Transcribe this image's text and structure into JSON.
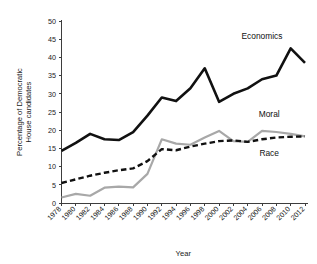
{
  "chart_data": {
    "type": "line",
    "title": "",
    "xlabel": "Year",
    "ylabel": "Percentage of Democratic House candidates",
    "ylabel_line1": "Percentage of Democratic",
    "ylabel_line2": "House candidates",
    "ylim": [
      0,
      50
    ],
    "yticks": [
      0,
      5,
      10,
      15,
      20,
      25,
      30,
      35,
      40,
      45,
      50
    ],
    "grid": false,
    "legend_position": "inline-annotations",
    "categories": [
      "1978",
      "1980",
      "1982",
      "1984",
      "1986",
      "1988",
      "1990",
      "1992",
      "1994",
      "1996",
      "1998",
      "2000",
      "2002",
      "2004",
      "2006",
      "2008",
      "2010",
      "2012"
    ],
    "x": [
      1978,
      1980,
      1982,
      1984,
      1986,
      1988,
      1990,
      1992,
      1994,
      1996,
      1998,
      2000,
      2002,
      2004,
      2006,
      2008,
      2010,
      2012
    ],
    "series": [
      {
        "name": "Economics",
        "color": "#111111",
        "style": "solid",
        "width": 2.6,
        "values": [
          14.3,
          16.5,
          19.0,
          17.5,
          17.3,
          19.5,
          24.0,
          29.0,
          28.0,
          31.5,
          37.0,
          27.8,
          30.0,
          31.5,
          34.0,
          35.0,
          42.5,
          38.5
        ]
      },
      {
        "name": "Moral",
        "color": "#a8a8a8",
        "style": "solid",
        "width": 2.2,
        "values": [
          1.5,
          2.5,
          2.0,
          4.2,
          4.5,
          4.3,
          8.0,
          17.5,
          16.3,
          16.0,
          18.0,
          19.8,
          17.0,
          16.8,
          19.8,
          19.5,
          19.0,
          18.3
        ]
      },
      {
        "name": "Race",
        "color": "#111111",
        "style": "dashed",
        "width": 2.4,
        "values": [
          5.5,
          6.5,
          7.5,
          8.3,
          9.0,
          9.5,
          11.5,
          14.8,
          14.5,
          15.5,
          16.3,
          17.0,
          17.2,
          16.8,
          17.5,
          18.0,
          18.2,
          18.3
        ]
      }
    ],
    "annotations": [
      {
        "text": "Economics",
        "x": 2006,
        "y": 45.0
      },
      {
        "text": "Moral",
        "x": 2007,
        "y": 23.5
      },
      {
        "text": "Race",
        "x": 2007,
        "y": 13.0
      }
    ]
  }
}
